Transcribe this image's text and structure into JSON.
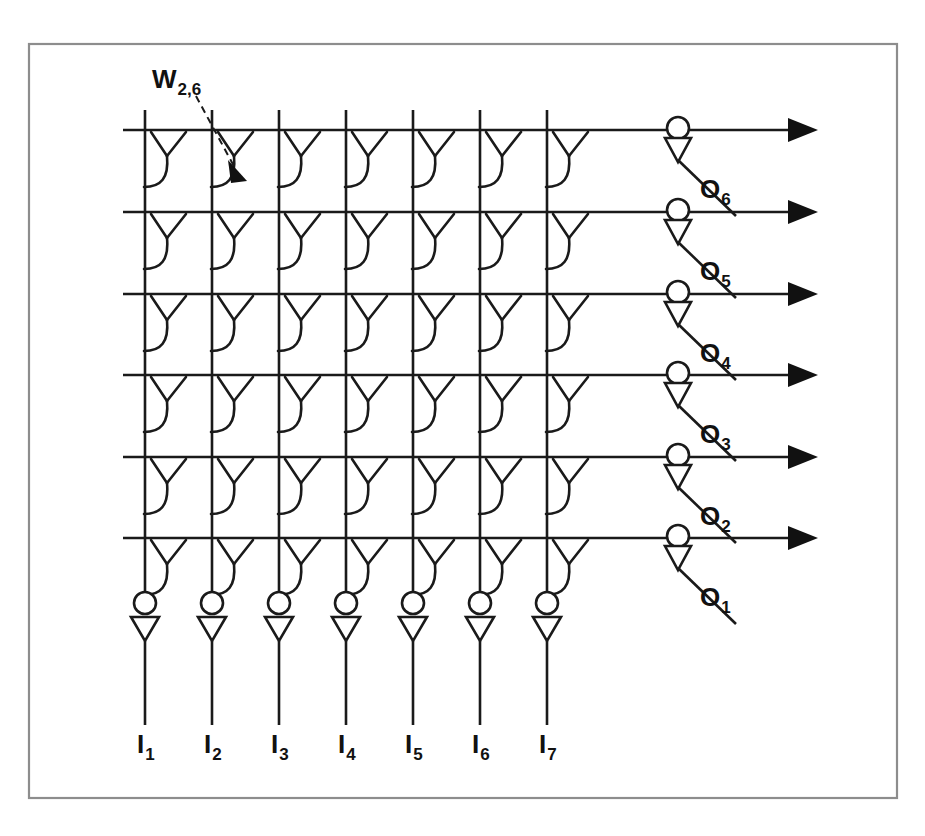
{
  "figure": {
    "background_color": "#ffffff",
    "line_color": "#1a1a1a",
    "frame_color": "#8d8d8d"
  },
  "annotation": {
    "weight_label_base": "W",
    "weight_label_sub": "2,6",
    "icon": "dashed-arrow-icon"
  },
  "inputs": {
    "count": 7,
    "items": [
      {
        "base": "I",
        "sub": "1"
      },
      {
        "base": "I",
        "sub": "2"
      },
      {
        "base": "I",
        "sub": "3"
      },
      {
        "base": "I",
        "sub": "4"
      },
      {
        "base": "I",
        "sub": "5"
      },
      {
        "base": "I",
        "sub": "6"
      },
      {
        "base": "I",
        "sub": "7"
      }
    ]
  },
  "outputs": {
    "count": 6,
    "items": [
      {
        "base": "O",
        "sub": "1"
      },
      {
        "base": "O",
        "sub": "2"
      },
      {
        "base": "O",
        "sub": "3"
      },
      {
        "base": "O",
        "sub": "4"
      },
      {
        "base": "O",
        "sub": "5"
      },
      {
        "base": "O",
        "sub": "6"
      }
    ]
  },
  "chart_data": {
    "type": "diagram",
    "rows": 6,
    "columns": 7,
    "synapse_count": 42,
    "row_labels": [
      "O1",
      "O2",
      "O3",
      "O4",
      "O5",
      "O6"
    ],
    "column_labels": [
      "I1",
      "I2",
      "I3",
      "I4",
      "I5",
      "I6",
      "I7"
    ],
    "highlighted_weight": "W2,6",
    "highlighted_weight_row": 6,
    "highlighted_weight_column": 2,
    "geometry": {
      "frame": {
        "x": 29,
        "y": 44,
        "width": 868,
        "height": 754
      },
      "column_x": [
        145,
        212,
        279,
        346,
        413,
        480,
        547
      ],
      "row_y": [
        538,
        457,
        375,
        294,
        212,
        130
      ],
      "output_neuron_x": 678,
      "output_arrow_x": 790,
      "input_neuron_y": 603,
      "input_label_y": 753
    }
  }
}
